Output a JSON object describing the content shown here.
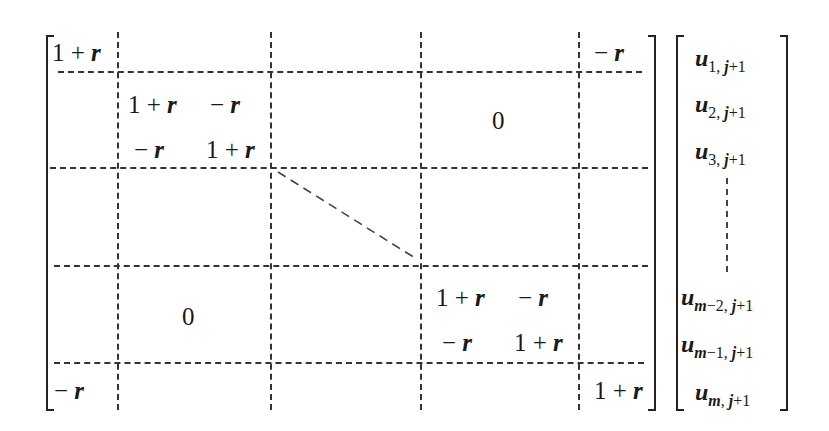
{
  "equation": {
    "description": "Block tridiagonal-like (periodic) matrix times unknown vector",
    "matrix": {
      "top_left": "1 + r",
      "top_right": "− r",
      "bottom_left": "− r",
      "bottom_right": "1 + r",
      "block_upper": {
        "a11": "1 + r",
        "a12": "− r",
        "a21": "− r",
        "a22": "1 + r"
      },
      "block_lower": {
        "a11": "1 + r",
        "a12": "− r",
        "a21": "− r",
        "a22": "1 + r"
      },
      "zero_upper_right": "0",
      "zero_lower_left": "0"
    },
    "vector": [
      {
        "base": "u",
        "sub": "1, j+1"
      },
      {
        "base": "u",
        "sub": "2, j+1"
      },
      {
        "base": "u",
        "sub": "3, j+1"
      },
      {
        "base": "u",
        "sub": "m−2, j+1"
      },
      {
        "base": "u",
        "sub": "m−1, j+1"
      },
      {
        "base": "u",
        "sub": "m, j+1"
      }
    ]
  }
}
